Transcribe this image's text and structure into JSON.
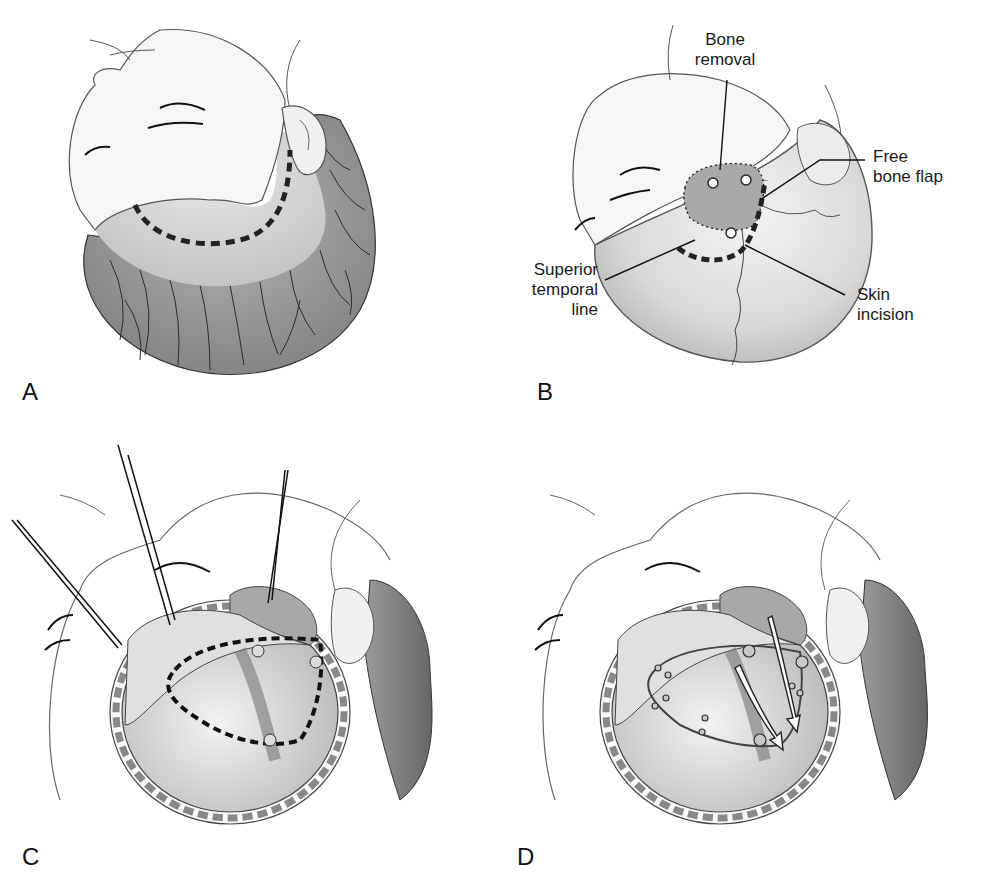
{
  "figure": {
    "panels": [
      {
        "id": "A",
        "letter": "A",
        "description": "Head turned, planned curved skin incision (dashed) behind hairline"
      },
      {
        "id": "B",
        "letter": "B",
        "description": "Skull exposed showing bone removal, free bone flap and incision"
      },
      {
        "id": "C",
        "letter": "C",
        "description": "Scalp retracted with clips, dural opening outlined (dashed)"
      },
      {
        "id": "D",
        "letter": "D",
        "description": "Dura tacked up with sutures, arrows showing flap rotation"
      }
    ],
    "callouts": {
      "bone_removal": {
        "line1": "Bone",
        "line2": "removal"
      },
      "free_bone_flap": {
        "line1": "Free",
        "line2": "bone flap"
      },
      "superior_temporal_line": {
        "line1": "Superior",
        "line2": "temporal",
        "line3": "line"
      },
      "skin_incision": {
        "line1": "Skin",
        "line2": "incision"
      }
    },
    "caption_truncated": "· · ·"
  },
  "colors": {
    "line": "#555555",
    "ink": "#1a1a1a",
    "hair": "#8a8a8a",
    "skin": "#f4f4f4",
    "shaved": "#d9d9d9",
    "bone": "#bdbdbd",
    "dura": "#c8c8c8"
  }
}
